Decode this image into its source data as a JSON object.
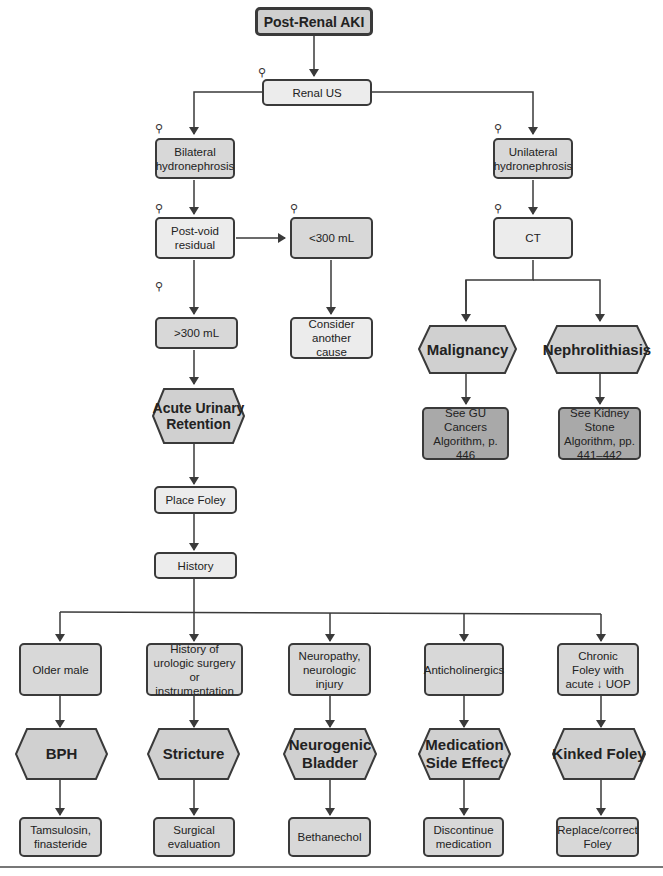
{
  "colors": {
    "line": "#3a3a3a",
    "light_box": "#ececec",
    "mid_box": "#d8d8d8",
    "dark_box": "#a9a9a9",
    "hex_fill": "#d0d0d0"
  },
  "icon": {
    "name": "microscope-icon",
    "glyph": "⚲"
  },
  "nodes": {
    "root": "Post-Renal AKI",
    "renal_us": "Renal US",
    "bilateral": "Bilateral hydronephrosis",
    "unilateral": "Unilateral hydronephrosis",
    "pvr": "Post-void residual",
    "lt300": "<300 mL",
    "gt300": ">300 mL",
    "consider": "Consider another cause",
    "ct": "CT",
    "malignancy": "Malignancy",
    "nephro": "Nephrolithiasis",
    "gu_ref": "See GU Cancers Algorithm, p. 446",
    "kidney_ref": "See Kidney Stone Algorithm, pp. 441–442",
    "aur": "Acute Urinary Retention",
    "foley": "Place Foley",
    "history": "History"
  },
  "branches": [
    {
      "cause": "Older male",
      "dx": "BPH",
      "tx": "Tamsulosin, finasteride"
    },
    {
      "cause": "History of urologic surgery or instrumentation",
      "dx": "Stricture",
      "tx": "Surgical evaluation"
    },
    {
      "cause": "Neuropathy, neurologic injury",
      "dx": "Neurogenic Bladder",
      "tx": "Bethanechol"
    },
    {
      "cause": "Anticholinergics",
      "dx": "Medication Side Effect",
      "tx": "Discontinue medication"
    },
    {
      "cause": "Chronic Foley with acute ↓ UOP",
      "dx": "Kinked Foley",
      "tx": "Replace/correct Foley"
    }
  ]
}
